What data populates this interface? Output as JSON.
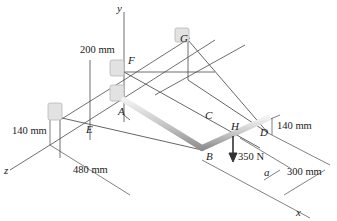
{
  "figure": {
    "axes": {
      "x": "x",
      "y": "y",
      "z": "z"
    },
    "points": {
      "A": "A",
      "B": "B",
      "C": "C",
      "D": "D",
      "E": "E",
      "F": "F",
      "G": "G",
      "H": "H"
    },
    "dimensions": {
      "d200": "200 mm",
      "d140_top": "140 mm",
      "d140_left": "140 mm",
      "d480": "480 mm",
      "d300": "300 mm",
      "a": "a"
    },
    "load": "350 N",
    "colors": {
      "line": "#4a4a4a",
      "rod": "#c9c9c9",
      "bracket": "#d8d8d8"
    }
  }
}
